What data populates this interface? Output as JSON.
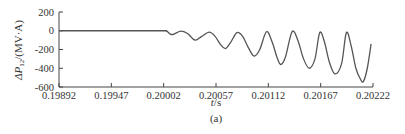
{
  "chart_data": {
    "type": "line",
    "title": "",
    "caption": "(a)",
    "xlabel": "t/s",
    "ylabel": "ΔP12/(MV·A)",
    "ylabel_parts": {
      "prefix": "ΔP",
      "subscript": "12",
      "suffix": "/(MV·A)"
    },
    "xlim": [
      0.19892,
      0.20222
    ],
    "ylim": [
      -600,
      200
    ],
    "xticks": [
      0.19892,
      0.19947,
      0.20002,
      0.20057,
      0.20112,
      0.20167,
      0.20222
    ],
    "xtick_labels": [
      "0.19892",
      "0.19947",
      "0.20002",
      "0.20057",
      "0.20112",
      "0.20167",
      "0.20222"
    ],
    "yticks": [
      200,
      0,
      -200,
      -400,
      -600
    ],
    "ytick_labels": [
      "200",
      "0",
      "-200",
      "-400",
      "-600"
    ],
    "grid": false,
    "legend": null,
    "series": [
      {
        "name": "ΔP12",
        "color": "#555555",
        "x": [
          0.19892,
          0.1995,
          0.2,
          0.20005,
          0.2001,
          0.20014,
          0.2002,
          0.20027,
          0.20035,
          0.20042,
          0.2005,
          0.20056,
          0.20062,
          0.20067,
          0.20072,
          0.20079,
          0.20085,
          0.20091,
          0.20097,
          0.20103,
          0.2011,
          0.20116,
          0.20121,
          0.20125,
          0.2013,
          0.20137,
          0.20143,
          0.20149,
          0.20155,
          0.20161,
          0.20166,
          0.20171,
          0.20176,
          0.20182,
          0.20189,
          0.20194,
          0.20199,
          0.20204,
          0.20209,
          0.20212,
          0.20216,
          0.2022
        ],
        "y": [
          0,
          0,
          0,
          -5,
          -40,
          -30,
          -5,
          -30,
          -100,
          -60,
          -15,
          -60,
          -150,
          -190,
          -130,
          -20,
          -60,
          -180,
          -270,
          -200,
          -10,
          -120,
          -280,
          -360,
          -280,
          -10,
          -100,
          -300,
          -400,
          -300,
          -20,
          -120,
          -330,
          -460,
          -350,
          -20,
          -160,
          -400,
          -520,
          -540,
          -400,
          -140
        ]
      }
    ]
  }
}
